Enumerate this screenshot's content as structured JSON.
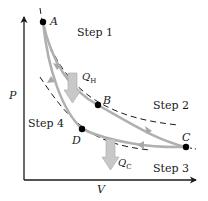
{
  "figure": {
    "type": "Carnot cycle P-V diagram",
    "axes": {
      "x_label": "V",
      "y_label": "P"
    },
    "points": [
      {
        "id": "A",
        "label": "A"
      },
      {
        "id": "B",
        "label": "B"
      },
      {
        "id": "C",
        "label": "C"
      },
      {
        "id": "D",
        "label": "D"
      }
    ],
    "steps": [
      {
        "id": "step1",
        "label": "Step 1"
      },
      {
        "id": "step2",
        "label": "Step 2"
      },
      {
        "id": "step3",
        "label": "Step 3"
      },
      {
        "id": "step4",
        "label": "Step 4"
      }
    ],
    "heat": {
      "hot": {
        "base": "Q",
        "sub": "H"
      },
      "cold": {
        "base": "Q",
        "sub": "C"
      }
    },
    "colors": {
      "cycle_path": "#b0b0b0",
      "heat_arrow": "#c8c8c8",
      "axes": "#1a1a1a",
      "dashed_isotherm": "#1a1a1a",
      "points": "#000000"
    }
  }
}
